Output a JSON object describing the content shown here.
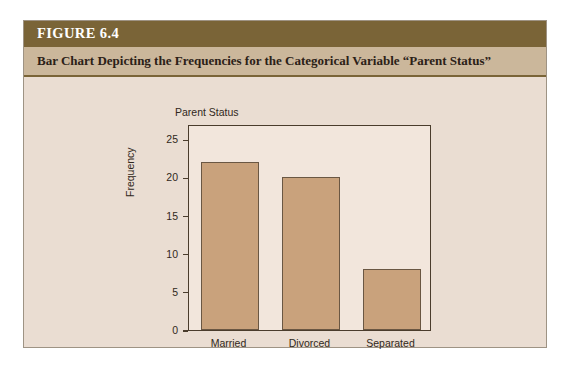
{
  "figure": {
    "number_label": "FIGURE 6.4",
    "caption": "Bar Chart Depicting the Frequencies for the Categorical Variable “Parent Status”"
  },
  "colors": {
    "header_band": "#7a6437",
    "caption_band": "#cbb79b",
    "panel_background": "#eaddd2",
    "plot_background": "#f2e6dc",
    "bar_fill": "#c9a27c",
    "bar_border": "#6a5743",
    "axis": "#4a3c2c",
    "page_background": "#ffffff"
  },
  "chart_data": {
    "type": "bar",
    "title": "Parent Status",
    "xlabel": "",
    "ylabel": "Frequency",
    "categories": [
      "Married",
      "Divorced",
      "Separated"
    ],
    "values": [
      22,
      20,
      8
    ],
    "ylim": [
      0,
      27
    ],
    "yticks": [
      0,
      5,
      10,
      15,
      20,
      25
    ],
    "ytick_labels": [
      "0",
      "5",
      "10",
      "15",
      "20",
      "25"
    ],
    "grid": false,
    "legend": false
  }
}
